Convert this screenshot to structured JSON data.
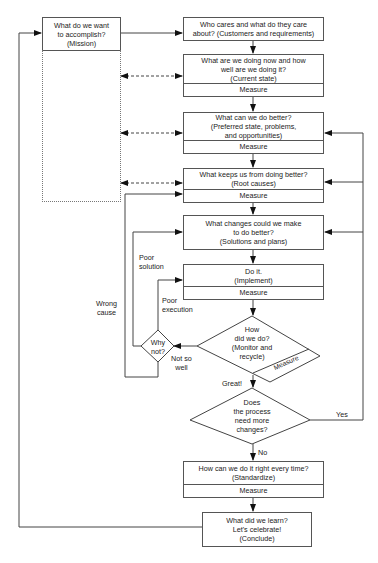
{
  "diagram": {
    "type": "flowchart",
    "mission": {
      "line1": "What do we want",
      "line2": "to accomplish?",
      "line3": "(Mission)"
    },
    "steps": [
      {
        "id": "customers",
        "lines": [
          "Who cares and what do they care",
          "about? (Customers and requirements)"
        ],
        "measure": null
      },
      {
        "id": "current-state",
        "lines": [
          "What are we doing now and how",
          "well are we doing it?",
          "(Current state)"
        ],
        "measure": "Measure"
      },
      {
        "id": "preferred-state",
        "lines": [
          "What can we do better?",
          "(Preferred state, problems,",
          "and opportunities)"
        ],
        "measure": "Measure"
      },
      {
        "id": "root-causes",
        "lines": [
          "What keeps us from doing better?",
          "(Root causes)"
        ],
        "measure": "Measure"
      },
      {
        "id": "solutions",
        "lines": [
          "What changes could we make",
          "to do better?",
          "(Solutions and plans)"
        ],
        "measure": null
      },
      {
        "id": "implement",
        "lines": [
          "Do it.",
          "(Implement)"
        ],
        "measure": "Measure"
      },
      {
        "id": "standardize",
        "lines": [
          "How can we do it right every time?",
          "(Standardize)"
        ],
        "measure": "Measure"
      },
      {
        "id": "conclude",
        "lines": [
          "What did we learn?",
          "Let's celebrate!",
          "(Conclude)"
        ],
        "measure": null
      }
    ],
    "decisions": {
      "monitor": {
        "lines": [
          "How",
          "did we do?",
          "(Monitor and",
          "recycle)"
        ],
        "measure": "Measure"
      },
      "why_not": {
        "lines": [
          "Why",
          "not?"
        ]
      },
      "more_changes": {
        "lines": [
          "Does",
          "the process",
          "need more",
          "changes?"
        ]
      }
    },
    "edge_labels": {
      "poor_solution": [
        "Poor",
        "solution"
      ],
      "poor_execution": [
        "Poor",
        "execution"
      ],
      "wrong_cause": [
        "Wrong",
        "cause"
      ],
      "not_so_well": [
        "Not so",
        "well"
      ],
      "great": "Great!",
      "yes": "Yes",
      "no": "No"
    }
  }
}
